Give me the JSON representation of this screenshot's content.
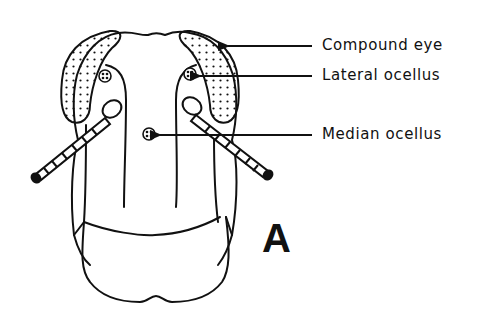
{
  "figure": {
    "panel_letter": "A",
    "labels": [
      {
        "id": "compound-eye",
        "text": "Compound eye"
      },
      {
        "id": "lateral-ocellus",
        "text": "Lateral ocellus"
      },
      {
        "id": "median-ocellus",
        "text": "Median ocellus"
      }
    ],
    "colors": {
      "line": "#111111",
      "background": "#ffffff"
    }
  }
}
